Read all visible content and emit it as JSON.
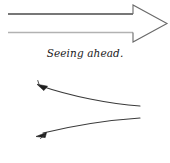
{
  "figure": {
    "background_color": "#ffffff",
    "width": 170,
    "height": 163
  },
  "panels": [
    {
      "id": "seeing-ahead",
      "caption": "Seeing ahead.",
      "graphic": "block-arrow-pointing-right",
      "stroke_color_dark": "#4a4a4a",
      "stroke_color_light": "#b0b0b0"
    },
    {
      "id": "seeing-behind",
      "caption": "Seeing behind.",
      "graphic": "two-diverging-curves-with-left-arrowheads",
      "stroke_color": "#3a3a3a"
    }
  ]
}
